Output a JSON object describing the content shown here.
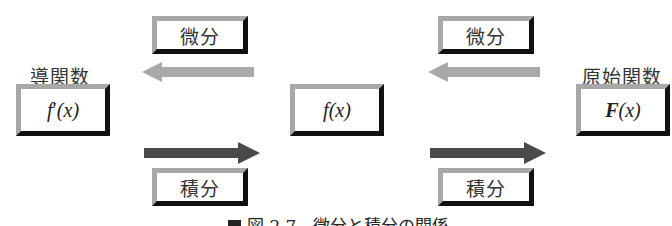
{
  "diagram": {
    "nodes": {
      "derivative": {
        "label": "導関数",
        "expr_f": "f",
        "expr_prime": "′",
        "expr_rest": "(x)"
      },
      "function": {
        "expr_f": "f",
        "expr_rest": "(x)"
      },
      "primitive": {
        "label": "原始関数",
        "expr_F": "F",
        "expr_rest": "(x)"
      }
    },
    "operations": {
      "left_differentiate": "微分",
      "left_integrate": "積分",
      "right_differentiate": "微分",
      "right_integrate": "積分"
    },
    "arrows": {
      "differentiate_color": "#a9a9a9",
      "integrate_color": "#4a4a4a"
    },
    "caption": "図 2.7　微分と積分の関係"
  }
}
